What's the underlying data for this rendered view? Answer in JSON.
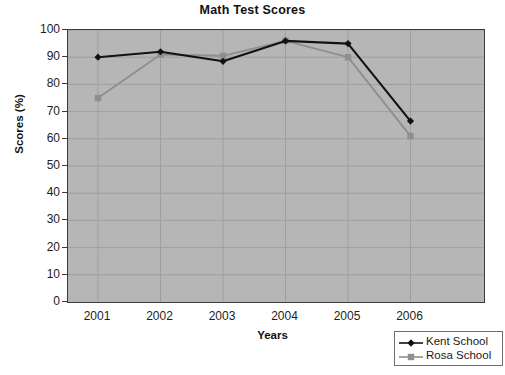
{
  "chart_data": {
    "type": "line",
    "title": "Math Test Scores",
    "xlabel": "Years",
    "ylabel": "Scores (%)",
    "categories": [
      "2001",
      "2002",
      "2003",
      "2004",
      "2005",
      "2006"
    ],
    "xtick_labels": [
      "2001",
      "2002",
      "2003",
      "2004",
      "2005",
      "2006"
    ],
    "ytick_labels": [
      "100",
      "90",
      "80",
      "70",
      "60",
      "50",
      "40",
      "30",
      "20",
      "10",
      "0"
    ],
    "ylim": [
      0,
      100
    ],
    "ytick_step": 10,
    "grid": true,
    "legend_position": "bottom-right",
    "plot_background": "#b6b6b6",
    "gridline_color": "#9f9f9f",
    "series": [
      {
        "name": "Kent School",
        "color": "#121212",
        "marker": "diamond",
        "values": [
          90,
          92,
          88.5,
          96,
          95,
          66.5
        ]
      },
      {
        "name": "Rosa School",
        "color": "#8f8f8f",
        "marker": "square",
        "values": [
          75,
          91,
          90.5,
          96,
          90,
          61
        ]
      }
    ]
  },
  "legend": {
    "entries": [
      {
        "label": "Kent School"
      },
      {
        "label": "Rosa School"
      }
    ]
  },
  "artifact": {
    "text": ""
  }
}
